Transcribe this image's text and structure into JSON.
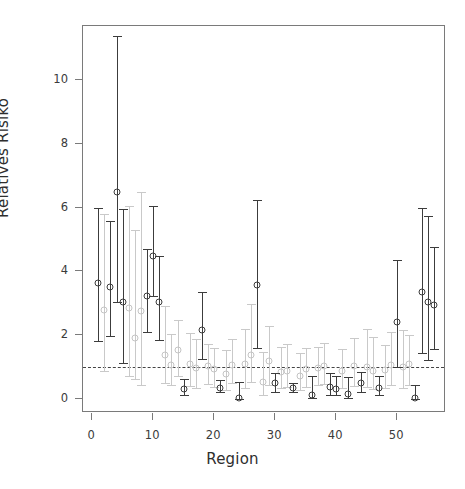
{
  "chart_data": {
    "type": "scatter",
    "title": "",
    "xlabel": "Region",
    "ylabel": "Relatives Risiko",
    "xlim": [
      -1.5,
      58
    ],
    "ylim": [
      -0.45,
      11.7
    ],
    "xticks": [
      0,
      10,
      20,
      30,
      40,
      50
    ],
    "xtick_labels": [
      "0",
      "10",
      "20",
      "30",
      "40",
      "50"
    ],
    "yticks": [
      0,
      2,
      4,
      6,
      8,
      10
    ],
    "ytick_labels": [
      "0",
      "2",
      "4",
      "6",
      "8",
      "10"
    ],
    "grid": false,
    "legend": "none",
    "reference_line": {
      "y": 1,
      "style": "dashed",
      "color": "#444444"
    },
    "series": [
      {
        "name": "significant",
        "color": "#3c3c3c",
        "marker": "open-circle",
        "points": [
          {
            "x": 1,
            "y": 3.62,
            "lo": 1.8,
            "hi": 6.0
          },
          {
            "x": 3,
            "y": 3.52,
            "lo": 1.98,
            "hi": 5.58
          },
          {
            "x": 4,
            "y": 6.5,
            "lo": 3.02,
            "hi": 11.4
          },
          {
            "x": 5,
            "y": 3.05,
            "lo": 1.12,
            "hi": 5.95
          },
          {
            "x": 9,
            "y": 3.22,
            "lo": 2.1,
            "hi": 4.7
          },
          {
            "x": 10,
            "y": 4.48,
            "lo": 3.22,
            "hi": 6.05
          },
          {
            "x": 11,
            "y": 3.03,
            "lo": 1.85,
            "hi": 4.48
          },
          {
            "x": 15,
            "y": 0.3,
            "lo": 0.1,
            "hi": 0.62
          },
          {
            "x": 18,
            "y": 2.15,
            "lo": 1.25,
            "hi": 3.35
          },
          {
            "x": 21,
            "y": 0.35,
            "lo": 0.2,
            "hi": 0.6
          },
          {
            "x": 24,
            "y": 0.02,
            "lo": 0.0,
            "hi": 0.52
          },
          {
            "x": 27,
            "y": 3.56,
            "lo": 1.58,
            "hi": 6.25
          },
          {
            "x": 30,
            "y": 0.48,
            "lo": 0.22,
            "hi": 0.82
          },
          {
            "x": 33,
            "y": 0.33,
            "lo": 0.22,
            "hi": 0.48
          },
          {
            "x": 36,
            "y": 0.12,
            "lo": 0.02,
            "hi": 0.72
          },
          {
            "x": 39,
            "y": 0.38,
            "lo": 0.12,
            "hi": 0.8
          },
          {
            "x": 40,
            "y": 0.3,
            "lo": 0.1,
            "hi": 0.72
          },
          {
            "x": 42,
            "y": 0.15,
            "lo": 0.02,
            "hi": 0.68
          },
          {
            "x": 44,
            "y": 0.5,
            "lo": 0.22,
            "hi": 0.85
          },
          {
            "x": 47,
            "y": 0.33,
            "lo": 0.1,
            "hi": 0.72
          },
          {
            "x": 50,
            "y": 2.4,
            "lo": 1.0,
            "hi": 4.35
          },
          {
            "x": 53,
            "y": 0.02,
            "lo": 0.0,
            "hi": 0.42
          },
          {
            "x": 54,
            "y": 3.34,
            "lo": 1.42,
            "hi": 6.0
          },
          {
            "x": 55,
            "y": 3.03,
            "lo": 1.2,
            "hi": 5.72
          },
          {
            "x": 56,
            "y": 2.95,
            "lo": 1.55,
            "hi": 4.76
          }
        ]
      },
      {
        "name": "non-significant",
        "color": "#c4c4c4",
        "marker": "open-circle",
        "points": [
          {
            "x": 2,
            "y": 2.78,
            "lo": 0.88,
            "hi": 5.8
          },
          {
            "x": 6,
            "y": 2.86,
            "lo": 0.72,
            "hi": 6.05
          },
          {
            "x": 7,
            "y": 1.9,
            "lo": 0.62,
            "hi": 5.3
          },
          {
            "x": 8,
            "y": 2.75,
            "lo": 0.42,
            "hi": 6.48
          },
          {
            "x": 12,
            "y": 1.38,
            "lo": 0.5,
            "hi": 2.9
          },
          {
            "x": 13,
            "y": 1.06,
            "lo": 0.42,
            "hi": 2.02
          },
          {
            "x": 14,
            "y": 1.52,
            "lo": 0.72,
            "hi": 2.48
          },
          {
            "x": 16,
            "y": 1.08,
            "lo": 0.4,
            "hi": 2.05
          },
          {
            "x": 17,
            "y": 0.95,
            "lo": 0.35,
            "hi": 1.88
          },
          {
            "x": 19,
            "y": 1.02,
            "lo": 0.45,
            "hi": 1.72
          },
          {
            "x": 20,
            "y": 0.92,
            "lo": 0.38,
            "hi": 1.6
          },
          {
            "x": 22,
            "y": 0.78,
            "lo": 0.26,
            "hi": 1.52
          },
          {
            "x": 23,
            "y": 1.05,
            "lo": 0.5,
            "hi": 1.88
          },
          {
            "x": 25,
            "y": 1.08,
            "lo": 0.34,
            "hi": 2.18
          },
          {
            "x": 26,
            "y": 1.38,
            "lo": 0.52,
            "hi": 2.98
          },
          {
            "x": 28,
            "y": 0.52,
            "lo": 0.12,
            "hi": 1.45
          },
          {
            "x": 29,
            "y": 1.18,
            "lo": 0.42,
            "hi": 2.28
          },
          {
            "x": 31,
            "y": 0.85,
            "lo": 0.32,
            "hi": 1.62
          },
          {
            "x": 32,
            "y": 0.88,
            "lo": 0.36,
            "hi": 1.72
          },
          {
            "x": 34,
            "y": 0.72,
            "lo": 0.28,
            "hi": 1.42
          },
          {
            "x": 35,
            "y": 0.92,
            "lo": 0.38,
            "hi": 1.6
          },
          {
            "x": 37,
            "y": 0.96,
            "lo": 0.42,
            "hi": 1.62
          },
          {
            "x": 38,
            "y": 1.02,
            "lo": 0.45,
            "hi": 1.75
          },
          {
            "x": 41,
            "y": 0.88,
            "lo": 0.34,
            "hi": 1.55
          },
          {
            "x": 43,
            "y": 1.02,
            "lo": 0.4,
            "hi": 1.9
          },
          {
            "x": 45,
            "y": 1.0,
            "lo": 0.38,
            "hi": 2.2
          },
          {
            "x": 46,
            "y": 0.86,
            "lo": 0.3,
            "hi": 1.95
          },
          {
            "x": 48,
            "y": 0.9,
            "lo": 0.34,
            "hi": 1.7
          },
          {
            "x": 49,
            "y": 1.05,
            "lo": 0.42,
            "hi": 2.1
          },
          {
            "x": 51,
            "y": 1.0,
            "lo": 0.35,
            "hi": 2.15
          },
          {
            "x": 52,
            "y": 1.1,
            "lo": 0.44,
            "hi": 2.0
          }
        ]
      }
    ]
  }
}
